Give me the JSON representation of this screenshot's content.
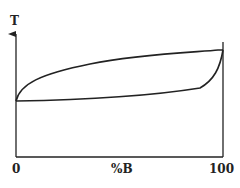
{
  "diagram": {
    "y_axis": {
      "label": "T"
    },
    "x_axis": {
      "label": "%B",
      "ticks": [
        "0",
        "100"
      ]
    },
    "curves": [
      {
        "name": "liquidus",
        "description": "upper curve, concave down from left melting point to right melting point"
      },
      {
        "name": "solidus",
        "description": "lower curve, nearly linear from left melting point to right melting point"
      }
    ],
    "colors": {
      "line": "#222222",
      "background": "#ffffff"
    }
  }
}
